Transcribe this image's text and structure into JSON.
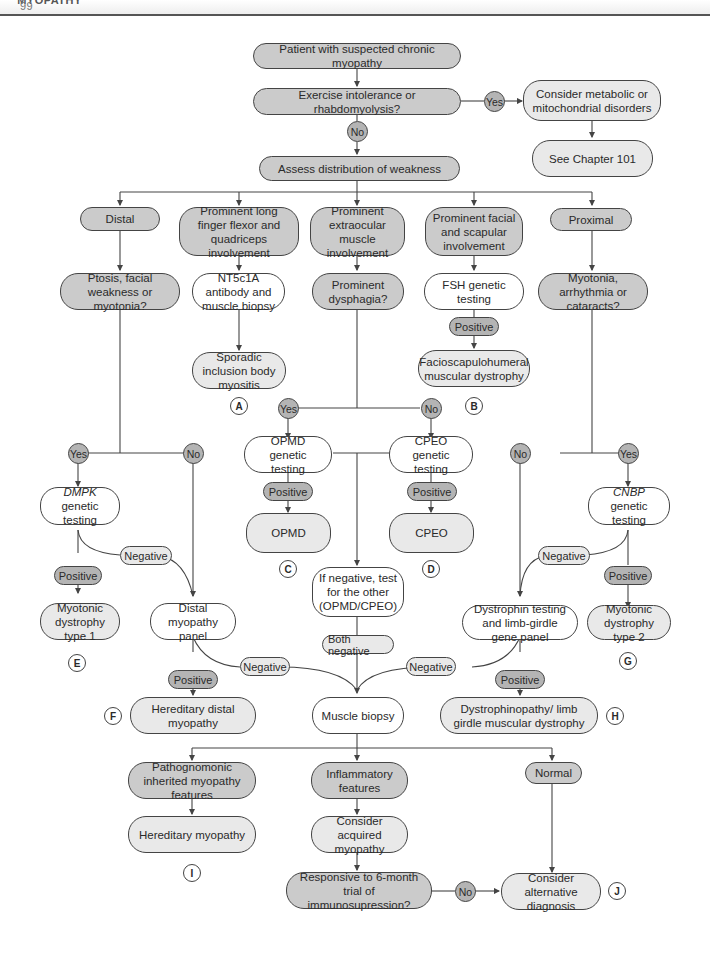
{
  "header": {
    "chapter": "CHAPTER 99",
    "title": "MYOPATHY"
  },
  "nodes": {
    "start": "Patient with suspected chronic myopathy",
    "exercise": "Exercise intolerance or rhabdomyolysis?",
    "metabolic": "Consider metabolic or mitochondrial disorders",
    "see_chapter": "See Chapter 101",
    "assess": "Assess distribution of weakness",
    "distal": "Distal",
    "long_finger": "Prominent long finger flexor and quadriceps involvement",
    "extraocular": "Prominent extraocular muscle involvement",
    "facial_scapular": "Prominent facial and scapular involvement",
    "proximal": "Proximal",
    "ptosis": "Ptosis, facial weakness or myotonia?",
    "nt5c1a": "NT5c1A antibody and muscle biopsy",
    "dysphagia": "Prominent dysphagia?",
    "fsh": "FSH genetic testing",
    "myotonia_q": "Myotonia, arrhythmia or cataracts?",
    "sibm": "Sporadic inclusion body myositis",
    "fshd": "Facioscapulohumeral muscular dystrophy",
    "opmd_test": "OPMD genetic testing",
    "cpeo_test": "CPEO genetic testing",
    "opmd": "OPMD",
    "cpeo": "CPEO",
    "dmpk_italic": "DMPK",
    "dmpk_rest": " genetic testing",
    "cnbp_italic": "CNBP",
    "cnbp_rest": " genetic testing",
    "dm1": "Myotonic dystrophy type 1",
    "distal_panel": "Distal myopathy panel",
    "if_negative": "If negative, test for the other (OPMD/CPEO)",
    "dystrophin": "Dystrophin testing and limb-girdle gene panel",
    "dm2": "Myotonic dystrophy type 2",
    "hered_distal": "Hereditary distal myopathy",
    "biopsy": "Muscle biopsy",
    "dystrophinopathy": "Dystrophinopathy/ limb girdle muscular dystrophy",
    "pathognomonic": "Pathognomonic inherited myopathy features",
    "inflammatory": "Inflammatory features",
    "normal": "Normal",
    "hered_myopathy": "Hereditary myopathy",
    "acquired": "Consider acquired myopathy",
    "responsive": "Responsive to 6-month trial of immunosupression?",
    "alternative": "Consider alternative diagnosis"
  },
  "edge_labels": {
    "yes": "Yes",
    "no": "No",
    "positive": "Positive",
    "negative": "Negative",
    "both_negative": "Both negative"
  },
  "markers": [
    "A",
    "B",
    "C",
    "D",
    "E",
    "F",
    "G",
    "H",
    "I",
    "J"
  ],
  "colors": {
    "dark_fill": "#cbcbcb",
    "light_fill": "#e9e9e9",
    "pill_fill": "#b4b4b4",
    "stroke": "#444444"
  }
}
